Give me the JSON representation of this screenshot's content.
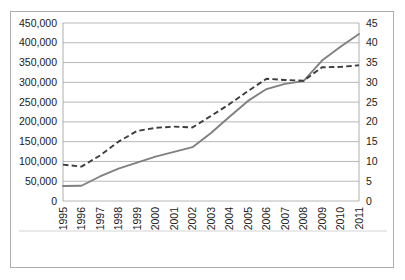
{
  "chart_data": {
    "type": "line",
    "title": "",
    "subtitle": "",
    "xlabel": "",
    "ylabel": "",
    "grid": true,
    "legend_position": "bottom",
    "categories": [
      "1995",
      "1996",
      "1997",
      "1998",
      "1999",
      "2000",
      "2001",
      "2002",
      "2003",
      "2004",
      "2005",
      "2006",
      "2007",
      "2008",
      "2009",
      "2010",
      "2011"
    ],
    "x_tick_labels": [
      "1995",
      "1996",
      "1997",
      "1998",
      "1999",
      "2000",
      "2001",
      "2002",
      "2003",
      "2004",
      "2005",
      "2006",
      "2007",
      "2008",
      "2009",
      "2010",
      "2011"
    ],
    "y_left_ticks": [
      "0",
      "50,000",
      "100,000",
      "150,000",
      "200,000",
      "250,000",
      "300,000",
      "350,000",
      "400,000",
      "450,000"
    ],
    "y_left_values": [
      0,
      50000,
      100000,
      150000,
      200000,
      250000,
      300000,
      350000,
      400000,
      450000
    ],
    "y_right_ticks": [
      "0",
      "5",
      "10",
      "15",
      "20",
      "25",
      "30",
      "35",
      "40",
      "45"
    ],
    "y_right_values": [
      0,
      5,
      10,
      15,
      20,
      25,
      30,
      35,
      40,
      45
    ],
    "ylim_left": [
      0,
      450000
    ],
    "ylim_right": [
      0,
      45
    ],
    "series": [
      {
        "name": "National currency (left)",
        "axis": "left",
        "style": "solid",
        "color": "#808080",
        "values": [
          38000,
          38500,
          62000,
          82000,
          97000,
          112000,
          124000,
          136000,
          172000,
          213000,
          253000,
          283000,
          296000,
          303000,
          355000,
          390000,
          422000
        ]
      },
      {
        "name": "Percent of GDP (right)",
        "axis": "right",
        "style": "dashed",
        "color": "#3d3d3d",
        "values": [
          9.2,
          8.7,
          11.5,
          15.0,
          17.7,
          18.5,
          18.8,
          18.6,
          21.5,
          24.5,
          27.8,
          30.9,
          30.6,
          30.4,
          33.8,
          33.9,
          34.3
        ]
      }
    ]
  },
  "legend": {
    "items": [
      {
        "label": "National currency (left)",
        "style": "solid"
      },
      {
        "label": "Percent of GDP (right)",
        "style": "dashed"
      }
    ]
  }
}
